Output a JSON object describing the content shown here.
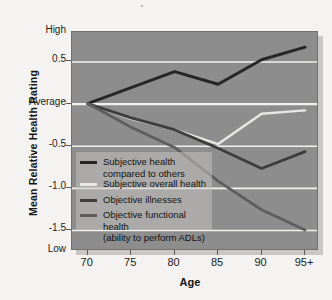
{
  "chart_data": {
    "type": "line",
    "title": "",
    "xlabel": "Age",
    "ylabel": "Mean Relative Health Rating",
    "x": [
      70,
      75,
      80,
      85,
      90,
      95
    ],
    "categories": [
      "70",
      "75",
      "80",
      "85",
      "90",
      "95+"
    ],
    "ylim": [
      -1.75,
      0.85
    ],
    "xlim": [
      68.2,
      96.6
    ],
    "grid": true,
    "gridlines": [
      0.5,
      0.0,
      -0.5,
      -1.0,
      -1.5
    ],
    "ytick_values": [
      0.85,
      0.5,
      0.0,
      -0.5,
      -1.0,
      -1.5,
      -1.75
    ],
    "ytick_labels": [
      "High",
      "0.5",
      "Average",
      "-0.5",
      "-1.0",
      "-1.5",
      "Low"
    ],
    "legend_position": "center-left",
    "series": [
      {
        "name": "Subjective health compared to others",
        "label_line1": "Subjective health",
        "label_line2": "compared to others",
        "color": "#262626",
        "width": 3.0,
        "values": [
          0.0,
          0.19,
          0.38,
          0.23,
          0.52,
          0.67
        ]
      },
      {
        "name": "Subjective overall health",
        "label_line1": "Subjective overall health",
        "label_line2": "",
        "color": "#e8e7e3",
        "width": 2.4,
        "values": [
          0.0,
          -0.18,
          -0.31,
          -0.48,
          -0.12,
          -0.08
        ]
      },
      {
        "name": "Objective illnesses",
        "label_line1": "Objective illnesses",
        "label_line2": "",
        "color": "#3d3d3d",
        "width": 2.8,
        "values": [
          0.0,
          -0.17,
          -0.31,
          -0.53,
          -0.77,
          -0.57
        ]
      },
      {
        "name": "Objective functional health (ability to perform ADLs)",
        "label_line1": "Objective functional health",
        "label_line2": "(ability to perform ADLs)",
        "color": "#5e5e5e",
        "width": 2.8,
        "values": [
          0.0,
          -0.28,
          -0.52,
          -0.92,
          -1.26,
          -1.5
        ]
      }
    ]
  },
  "figure": {
    "background": "#f4f3f1",
    "plot_background": "#8d8d8d",
    "gridline_color": "#f2f1ee",
    "border_color": "#6f6f6f"
  }
}
